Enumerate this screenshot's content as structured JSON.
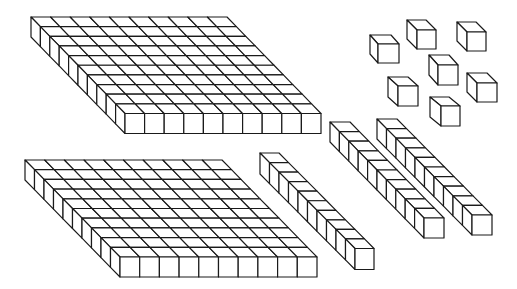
{
  "diagram": {
    "title": "Base-ten blocks",
    "description": "2 flats (hundreds), 3 rods (tens), 7 unit cubes (ones)",
    "stroke_color": "#1a1a1a",
    "fill_color": "#ffffff",
    "background": "#ffffff"
  },
  "blocks": [
    {
      "name": "flat-1",
      "type": "flat",
      "cols": 10,
      "rows": 10,
      "x": 31,
      "y": 17,
      "s": 19.6,
      "dx": 9.4,
      "dy": 9.65,
      "h": 20
    },
    {
      "name": "flat-2",
      "type": "flat",
      "cols": 10,
      "rows": 10,
      "x": 25,
      "y": 160,
      "s": 19.7,
      "dx": 9.5,
      "dy": 9.7,
      "h": 20
    },
    {
      "name": "rod-1",
      "type": "rod",
      "cols": 1,
      "rows": 10,
      "x": 260,
      "y": 153,
      "s": 19,
      "dx": 9.5,
      "dy": 9.55,
      "h": 21
    },
    {
      "name": "rod-2",
      "type": "rod",
      "cols": 1,
      "rows": 10,
      "x": 330,
      "y": 122,
      "s": 20,
      "dx": 9.4,
      "dy": 9.6,
      "h": 20
    },
    {
      "name": "rod-3",
      "type": "rod",
      "cols": 1,
      "rows": 10,
      "x": 377,
      "y": 119,
      "s": 20,
      "dx": 9.5,
      "dy": 9.6,
      "h": 20
    },
    {
      "name": "unit-1",
      "type": "unit",
      "cols": 1,
      "rows": 1,
      "x": 370,
      "y": 35,
      "s": 21,
      "dx": 8,
      "dy": 9,
      "h": 19
    },
    {
      "name": "unit-2",
      "type": "unit",
      "cols": 1,
      "rows": 1,
      "x": 407,
      "y": 20,
      "s": 19,
      "dx": 10,
      "dy": 10,
      "h": 19
    },
    {
      "name": "unit-3",
      "type": "unit",
      "cols": 1,
      "rows": 1,
      "x": 457,
      "y": 22,
      "s": 19,
      "dx": 10,
      "dy": 10,
      "h": 19
    },
    {
      "name": "unit-4",
      "type": "unit",
      "cols": 1,
      "rows": 1,
      "x": 429,
      "y": 55,
      "s": 20,
      "dx": 9,
      "dy": 10,
      "h": 20
    },
    {
      "name": "unit-5",
      "type": "unit",
      "cols": 1,
      "rows": 1,
      "x": 388,
      "y": 77,
      "s": 20,
      "dx": 10,
      "dy": 9,
      "h": 20
    },
    {
      "name": "unit-6",
      "type": "unit",
      "cols": 1,
      "rows": 1,
      "x": 467,
      "y": 73,
      "s": 20,
      "dx": 10,
      "dy": 10,
      "h": 19
    },
    {
      "name": "unit-7",
      "type": "unit",
      "cols": 1,
      "rows": 1,
      "x": 430,
      "y": 97,
      "s": 19,
      "dx": 11,
      "dy": 9,
      "h": 20
    }
  ]
}
